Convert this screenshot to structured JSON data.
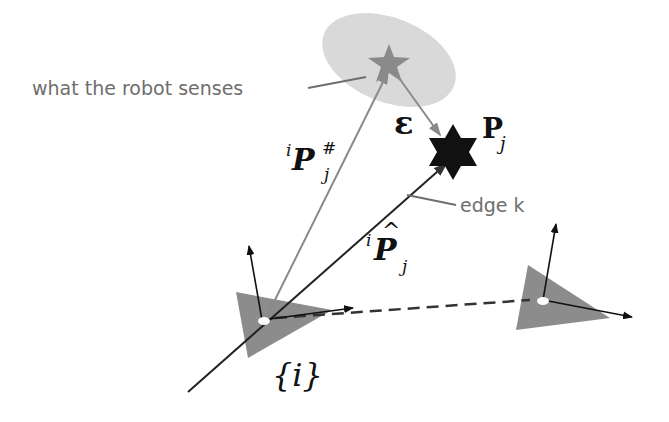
{
  "labels": {
    "sensed_annotation": "what the robot senses",
    "edge_annotation": "edge k",
    "measured_vector": {
      "base": "P",
      "pre_sup": "i",
      "sub": "j",
      "sup": "#"
    },
    "estimated_vector": {
      "base": "P",
      "pre_sup": "i",
      "sub": "j",
      "hat": "^"
    },
    "landmark": {
      "base": "P",
      "sub": "j"
    },
    "error": "ε",
    "frame": "{i}"
  },
  "colors": {
    "uncertainty_ellipse": "#d9d9d9",
    "sensed_star": "#8a8a8a",
    "true_star": "#111111",
    "robot_pose": "#8c8c8c",
    "measured_ray": "#8a8a8a",
    "estimated_ray": "#222222",
    "annotation_text": "#6e6e6e"
  },
  "elements": {
    "pose_i": {
      "cx": 262,
      "cy": 322
    },
    "pose_other": {
      "cx": 542,
      "cy": 300
    },
    "sensed_landmark": {
      "cx": 389,
      "cy": 65
    },
    "true_landmark": {
      "cx": 453,
      "cy": 152
    }
  }
}
